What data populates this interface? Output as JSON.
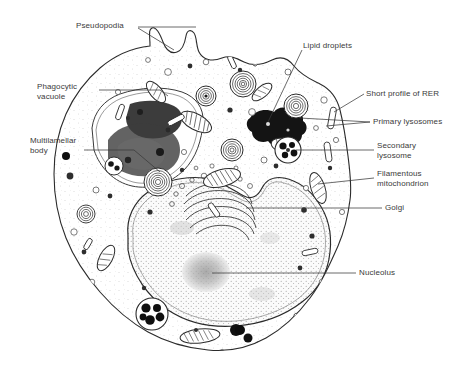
{
  "figure": {
    "background_color": "#ffffff",
    "ink_color": "#2b2b2b",
    "label_color": "#3a3a3a",
    "nucleus_fill": "#f2f2f2",
    "cytoplasm_fill": "#fdfdfd"
  },
  "labels": [
    {
      "id": "pseudopodia",
      "text": "Pseudopodia",
      "x": 76,
      "y": 24,
      "side": "left"
    },
    {
      "id": "phagocytic-vacuole",
      "text": "Phagocytic\nvacuole",
      "x": 37,
      "y": 84,
      "side": "left"
    },
    {
      "id": "multilamellar-body",
      "text": "Multilamellar\nbody",
      "x": 30,
      "y": 137,
      "side": "left"
    },
    {
      "id": "lipid-droplets",
      "text": "Lipid droplets",
      "x": 303,
      "y": 42,
      "side": "right"
    },
    {
      "id": "short-profile-of-rer",
      "text": "Short profile of RER",
      "x": 366,
      "y": 90,
      "side": "right"
    },
    {
      "id": "primary-lysosomes",
      "text": "Primary lysosomes",
      "x": 373,
      "y": 118,
      "side": "right"
    },
    {
      "id": "secondary-lysosome",
      "text": "Secondary\nlysosome",
      "x": 377,
      "y": 142,
      "side": "right"
    },
    {
      "id": "filamentous-mitochondrion",
      "text": "Filamentous\nmitochondrion",
      "x": 377,
      "y": 170,
      "side": "right"
    },
    {
      "id": "golgi",
      "text": "Golgi",
      "x": 385,
      "y": 204,
      "side": "right"
    },
    {
      "id": "nucleolus",
      "text": "Nucleolus",
      "x": 359,
      "y": 269,
      "side": "right"
    }
  ],
  "structures": [
    {
      "id": "cell-membrane",
      "name": "plasma membrane outline"
    },
    {
      "id": "pseudopod-upper",
      "name": "pseudopod projection"
    },
    {
      "id": "nucleus",
      "name": "nucleus"
    },
    {
      "id": "nucleolus-body",
      "name": "nucleolus"
    },
    {
      "id": "golgi-stack",
      "name": "golgi apparatus"
    },
    {
      "id": "phagosome",
      "name": "phagocytic vacuole with ingested material"
    },
    {
      "id": "lipid-droplet",
      "name": "lipid droplet"
    },
    {
      "id": "multilamellar-1",
      "name": "multilamellar body"
    },
    {
      "id": "multilamellar-2",
      "name": "multilamellar body"
    },
    {
      "id": "mitochondria",
      "name": "mitochondria"
    },
    {
      "id": "lysosome-cluster",
      "name": "secondary lysosome"
    },
    {
      "id": "rer-profiles",
      "name": "rough endoplasmic reticulum profiles"
    }
  ]
}
